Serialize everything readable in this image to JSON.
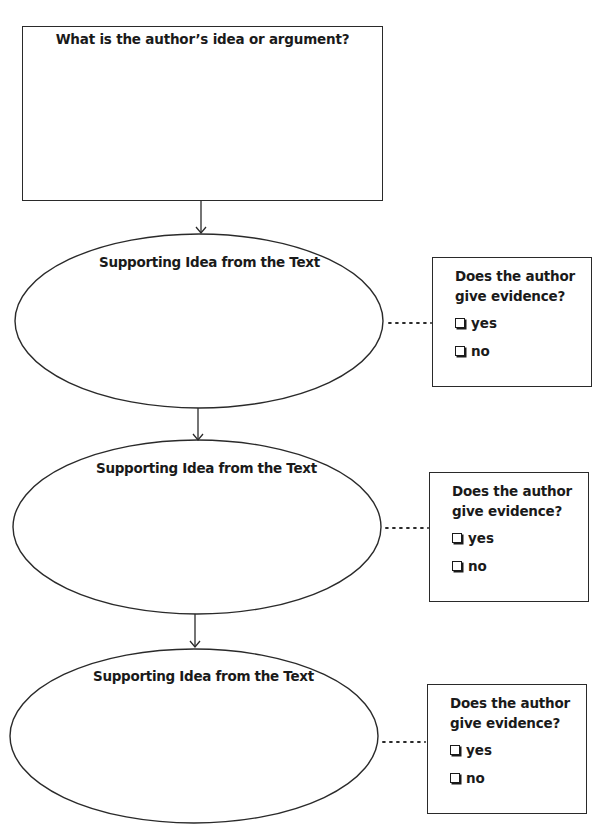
{
  "main_question": {
    "title": "What is the author’s idea or argument?"
  },
  "supporting_ideas": [
    {
      "label": "Supporting Idea from the Text",
      "evidence": {
        "question": "Does the author give evidence?",
        "question_lines": [
          "Does the author",
          "give evidence?"
        ],
        "options": [
          {
            "label": "yes",
            "checked": false
          },
          {
            "label": "no",
            "checked": false
          }
        ]
      }
    },
    {
      "label": "Supporting Idea from the Text",
      "evidence": {
        "question": "Does the author give evidence?",
        "question_lines": [
          "Does the author",
          "give evidence?"
        ],
        "options": [
          {
            "label": "yes",
            "checked": false
          },
          {
            "label": "no",
            "checked": false
          }
        ]
      }
    },
    {
      "label": "Supporting Idea from the Text",
      "evidence": {
        "question": "Does the author give evidence?",
        "question_lines": [
          "Does the author",
          "give evidence?"
        ],
        "options": [
          {
            "label": "yes",
            "checked": false
          },
          {
            "label": "no",
            "checked": false
          }
        ]
      }
    }
  ],
  "colors": {
    "stroke": "#2a2a2a",
    "text": "#1a1a1a",
    "background": "#ffffff"
  }
}
